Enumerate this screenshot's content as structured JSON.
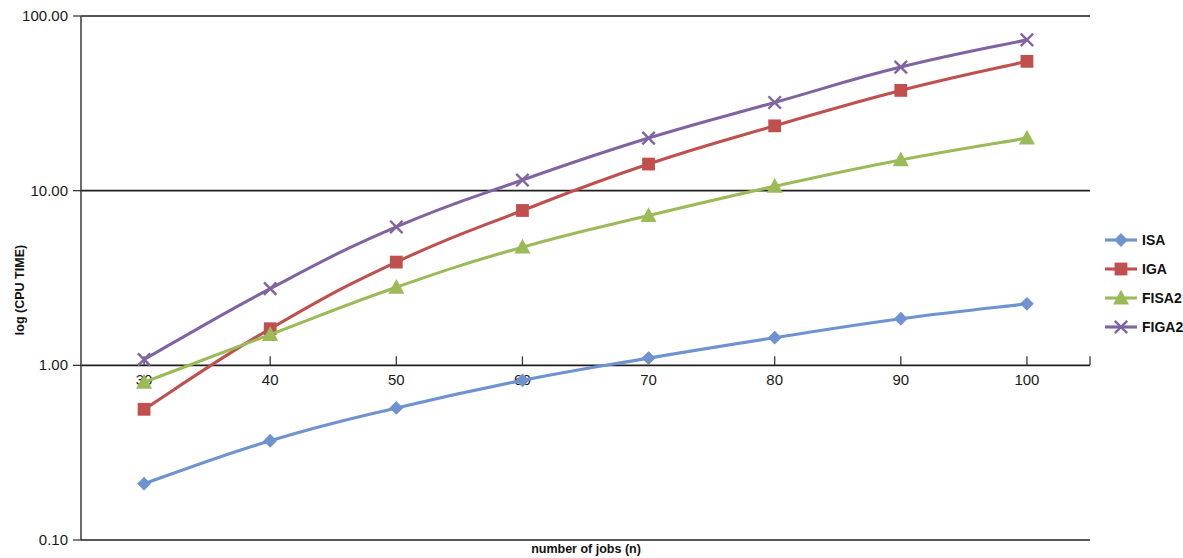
{
  "chart_data": {
    "type": "line",
    "title": "",
    "xlabel": "number of  jobs (n)",
    "ylabel": "log (CPU TIME)",
    "x": [
      30,
      40,
      50,
      60,
      70,
      80,
      90,
      100
    ],
    "xtick_labels": [
      "30",
      "40",
      "50",
      "60",
      "70",
      "80",
      "90",
      "100"
    ],
    "ytick_labels": [
      "100.00",
      "10.00",
      "1.00",
      "0.10"
    ],
    "ytick_values": [
      100.0,
      10.0,
      1.0,
      0.1
    ],
    "yscale": "log",
    "ylim": [
      0.1,
      100.0
    ],
    "xlim": [
      25,
      105
    ],
    "grid": true,
    "legend_position": "right",
    "series": [
      {
        "name": "ISA",
        "color": "#6f92d0",
        "marker": "diamond",
        "values": [
          0.21,
          0.37,
          0.57,
          0.82,
          1.1,
          1.44,
          1.85,
          2.25
        ]
      },
      {
        "name": "IGA",
        "color": "#c0504d",
        "marker": "square",
        "values": [
          0.56,
          1.62,
          3.9,
          7.7,
          14.2,
          23.5,
          37.5,
          55.0
        ]
      },
      {
        "name": "FISA2",
        "color": "#9bbb59",
        "marker": "triangle",
        "values": [
          0.8,
          1.5,
          2.8,
          4.75,
          7.2,
          10.6,
          15.0,
          20.0
        ]
      },
      {
        "name": "FIGA2",
        "color": "#8064a2",
        "marker": "cross",
        "values": [
          1.08,
          2.75,
          6.2,
          11.5,
          20.0,
          32.0,
          51.0,
          73.0
        ]
      }
    ]
  },
  "legend": {
    "items": [
      {
        "label": "ISA"
      },
      {
        "label": "IGA"
      },
      {
        "label": "FISA2"
      },
      {
        "label": "FIGA2"
      }
    ]
  },
  "axes": {
    "y_title": "log (CPU TIME)",
    "x_title": "number of  jobs (n)"
  }
}
